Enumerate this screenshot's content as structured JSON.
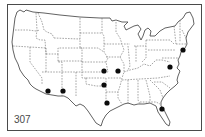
{
  "map": {
    "figure_number": "307",
    "region": "Contiguous United States",
    "style": "outline map with dashed state boundaries",
    "marker_color": "#0b0b0b",
    "markers": [
      {
        "id": "southeast-arizona",
        "x": 48,
        "y": 91
      },
      {
        "id": "southwest-new-mexico",
        "x": 63,
        "y": 91
      },
      {
        "id": "eastern-kansas",
        "x": 104,
        "y": 71
      },
      {
        "id": "central-missouri",
        "x": 118,
        "y": 71
      },
      {
        "id": "eastern-oklahoma",
        "x": 104,
        "y": 85
      },
      {
        "id": "east-texas",
        "x": 107,
        "y": 103
      },
      {
        "id": "maryland-virginia",
        "x": 170,
        "y": 67
      },
      {
        "id": "new-england-coast",
        "x": 183,
        "y": 50
      },
      {
        "id": "florida",
        "x": 162,
        "y": 109
      }
    ]
  }
}
